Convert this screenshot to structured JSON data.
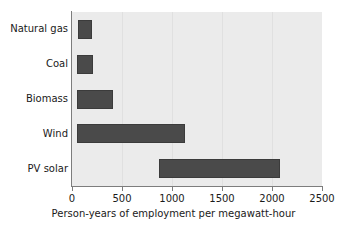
{
  "chart_data": {
    "type": "bar",
    "orientation": "horizontal",
    "bar_style": "range",
    "title": "",
    "xlabel": "Person-years of employment per megawatt-hour",
    "ylabel": "",
    "categories": [
      "Natural gas",
      "Coal",
      "Biomass",
      "Wind",
      "PV solar"
    ],
    "series": [
      {
        "name": "Employment range",
        "ranges": [
          {
            "category": "Natural gas",
            "start": 60,
            "end": 200
          },
          {
            "category": "Coal",
            "start": 50,
            "end": 210
          },
          {
            "category": "Biomass",
            "start": 50,
            "end": 410
          },
          {
            "category": "Wind",
            "start": 50,
            "end": 1130
          },
          {
            "category": "PV solar",
            "start": 870,
            "end": 2080
          }
        ]
      }
    ],
    "xlim": [
      0,
      2500
    ],
    "xticks": [
      0,
      500,
      1000,
      1500,
      2000,
      2500
    ],
    "xtick_labels": [
      "0",
      "500",
      "1000",
      "1500",
      "2000",
      "2500"
    ],
    "grid": true,
    "grid_axis": "x",
    "legend": false,
    "colors": {
      "bar_fill": "#4a4a4a",
      "bar_edge": "#3b3b3b",
      "plot_background": "#ebebeb",
      "figure_background": "#ffffff",
      "gridline": "#e0e0e0",
      "axis_line": "#7d7d7d",
      "text": "#1a1a1a"
    }
  }
}
